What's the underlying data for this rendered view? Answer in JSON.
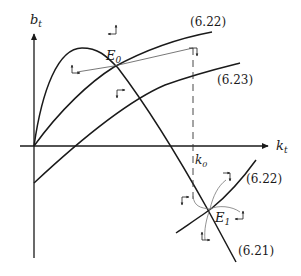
{
  "figure": {
    "type": "phase-diagram",
    "axes": {
      "y_label_main": "b",
      "y_label_sub": "t",
      "x_label_main": "k",
      "x_label_sub": "t"
    },
    "curves": [
      {
        "id": "6.21",
        "label": "(6.21)",
        "shape": "hump then descending"
      },
      {
        "id": "6.22",
        "label": "(6.22)",
        "shape": "rising concave (upper branch)"
      },
      {
        "id": "6.22b",
        "label": "(6.22)",
        "shape": "rising (lower branch near E1)"
      },
      {
        "id": "6.23",
        "label": "(6.23)",
        "shape": "rising concave, starts below axis"
      }
    ],
    "points": {
      "E0_main": "E",
      "E0_sub": "0",
      "E1_main": "E",
      "E1_sub": "1",
      "k0_main": "k",
      "k0_sub": "0"
    },
    "labels": {
      "upper_622": "(6.22)",
      "upper_623": "(6.23)",
      "lower_622": "(6.22)",
      "lower_621": "(6.21)"
    },
    "colors": {
      "line": "#1a1a1a",
      "thin_line": "#555555",
      "dashed": "#333333"
    }
  }
}
